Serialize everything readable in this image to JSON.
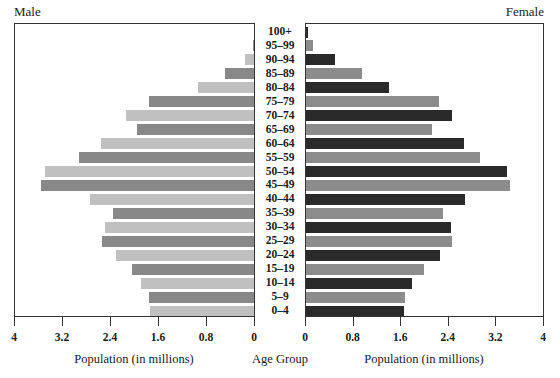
{
  "chart_data": {
    "type": "bar",
    "subtype": "population-pyramid",
    "title": "",
    "left_title": "Male",
    "right_title": "Female",
    "center_label": "Age Group",
    "xlabel_left": "Population (in millions)",
    "xlabel_right": "Population (in millions)",
    "xlim": [
      0,
      4
    ],
    "ticks_left": [
      "4",
      "3.2",
      "2.4",
      "1.6",
      "0.8",
      "0"
    ],
    "ticks_right": [
      "0",
      "0.8",
      "1.6",
      "2.4",
      "3.2",
      "4"
    ],
    "tick_values": [
      0,
      0.8,
      1.6,
      2.4,
      3.2,
      4
    ],
    "grid": false,
    "categories": [
      "100+",
      "95–99",
      "90–94",
      "85–89",
      "80–84",
      "75–79",
      "70–74",
      "65–69",
      "60–64",
      "55–59",
      "50–54",
      "45–49",
      "40–44",
      "35–39",
      "30–34",
      "25–29",
      "20–24",
      "15–19",
      "10–14",
      "5–9",
      "0–4"
    ],
    "series": [
      {
        "name": "Male",
        "colors": [
          "#c0c0c0",
          "#888888"
        ],
        "values": [
          0.0,
          0.02,
          0.15,
          0.48,
          0.93,
          1.75,
          2.13,
          1.95,
          2.55,
          2.92,
          3.48,
          3.55,
          2.73,
          2.35,
          2.48,
          2.53,
          2.3,
          2.03,
          1.88,
          1.75,
          1.73
        ]
      },
      {
        "name": "Female",
        "colors": [
          "#2a2a2a",
          "#8c8c8c"
        ],
        "values": [
          0.03,
          0.12,
          0.49,
          0.94,
          1.39,
          2.24,
          2.45,
          2.12,
          2.66,
          2.93,
          3.38,
          3.43,
          2.67,
          2.3,
          2.44,
          2.45,
          2.25,
          1.98,
          1.78,
          1.66,
          1.65
        ]
      }
    ]
  }
}
